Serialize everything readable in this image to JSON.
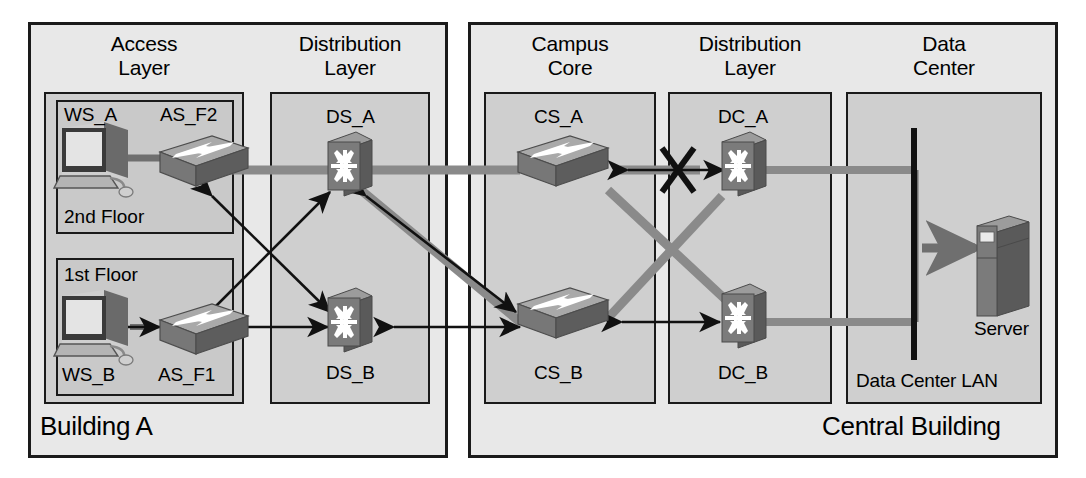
{
  "diagram": {
    "type": "network-topology",
    "buildings": [
      {
        "id": "building-a",
        "label": "Building A"
      },
      {
        "id": "central-building",
        "label": "Central Building"
      }
    ],
    "zones": [
      {
        "id": "access-layer",
        "title": "Access\nLayer"
      },
      {
        "id": "distribution-layer-a",
        "title": "Distribution\nLayer"
      },
      {
        "id": "campus-core",
        "title": "Campus\nCore"
      },
      {
        "id": "distribution-layer-b",
        "title": "Distribution\nLayer"
      },
      {
        "id": "data-center",
        "title": "Data\nCenter"
      }
    ],
    "subzones": [
      {
        "id": "second-floor",
        "label": "2nd Floor"
      },
      {
        "id": "first-floor",
        "label": "1st Floor"
      }
    ],
    "nodes": [
      {
        "id": "ws-a",
        "label": "WS_A",
        "icon": "workstation-icon"
      },
      {
        "id": "as-f2",
        "label": "AS_F2",
        "icon": "switch-icon"
      },
      {
        "id": "ws-b",
        "label": "WS_B",
        "icon": "workstation-icon"
      },
      {
        "id": "as-f1",
        "label": "AS_F1",
        "icon": "switch-icon"
      },
      {
        "id": "ds-a",
        "label": "DS_A",
        "icon": "multilayer-switch-icon"
      },
      {
        "id": "ds-b",
        "label": "DS_B",
        "icon": "multilayer-switch-icon"
      },
      {
        "id": "cs-a",
        "label": "CS_A",
        "icon": "switch-icon"
      },
      {
        "id": "cs-b",
        "label": "CS_B",
        "icon": "switch-icon"
      },
      {
        "id": "dc-a",
        "label": "DC_A",
        "icon": "multilayer-switch-icon"
      },
      {
        "id": "dc-b",
        "label": "DC_B",
        "icon": "multilayer-switch-icon"
      },
      {
        "id": "server",
        "label": "Server",
        "icon": "server-icon"
      },
      {
        "id": "dc-lan",
        "label": "Data Center LAN",
        "icon": "lan-bar-icon"
      }
    ],
    "annotations": [
      {
        "id": "broken-link-mark",
        "symbol": "X",
        "meaning": "link-blocked"
      }
    ],
    "colors": {
      "background": "#ffffff",
      "building_fill": "#e8e8e8",
      "zone_fill": "#cfcfcf",
      "subzone_fill": "#c9c9c9",
      "outline": "#1a1a1a",
      "link_gray": "#7d7d7d",
      "arrow_black": "#111111",
      "icon_dark": "#6e6e6e",
      "icon_light": "#b8b8b8",
      "icon_top": "#9a9a9a"
    }
  }
}
